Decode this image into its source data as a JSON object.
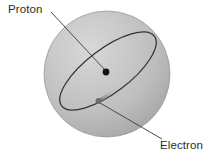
{
  "figure": {
    "type": "science-diagram",
    "background_color": "#ffffff",
    "width": 213,
    "height": 162
  },
  "labels": {
    "proton": "Proton",
    "electron": "Electron"
  },
  "colors": {
    "sphere_light": "#d2d2d2",
    "sphere_mid": "#b6b6b6",
    "sphere_dark": "#9a9a9a",
    "sphere_edge": "#8e8e8e",
    "orbit_stroke": "#3a3a3a",
    "leader_stroke": "#4a4a4a",
    "proton_dot": "#141414",
    "electron_dot": "#6a6a6a",
    "text": "#2b2b2b"
  },
  "geometry": {
    "sphere": {
      "cx": 107,
      "cy": 74,
      "r": 63
    },
    "orbit": {
      "cx": 108,
      "cy": 71,
      "rx": 58,
      "ry": 22,
      "rotation_deg": -37
    },
    "proton_dot": {
      "cx": 106,
      "cy": 72,
      "r": 3.4
    },
    "electron_dot": {
      "cx": 98.5,
      "cy": 101,
      "r": 2.9
    },
    "electron_trail": {
      "x1": 99,
      "y1": 101,
      "x2": 114,
      "y2": 91
    },
    "proton_leader": {
      "x1": 51,
      "y1": 12,
      "x2": 105,
      "y2": 70
    },
    "electron_leader": {
      "x1": 100,
      "y1": 103,
      "x2": 162,
      "y2": 139
    }
  }
}
